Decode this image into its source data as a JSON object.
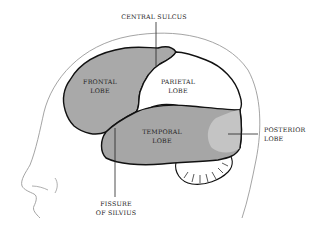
{
  "diagram": {
    "type": "anatomical-illustration",
    "colors": {
      "frontal": "#a9a9a9",
      "parietal": "#ffffff",
      "temporal": "#a6a6a6",
      "posterior": "#c4c4c4",
      "cerebellum": "#ffffff",
      "outline": "#111111",
      "head_outline": "#9a9a9a"
    },
    "labels": {
      "central_sulcus": "CENTRAL SULCUS",
      "frontal_line1": "FRONTAL",
      "frontal_line2": "LOBE",
      "parietal_line1": "PARIETAL",
      "parietal_line2": "LOBE",
      "temporal_line1": "TEMPORAL",
      "temporal_line2": "LOBE",
      "posterior_line1": "POSTERIOR",
      "posterior_line2": "LOBE",
      "fissure_line1": "FISSURE",
      "fissure_line2": "OF SILVIUS"
    }
  }
}
